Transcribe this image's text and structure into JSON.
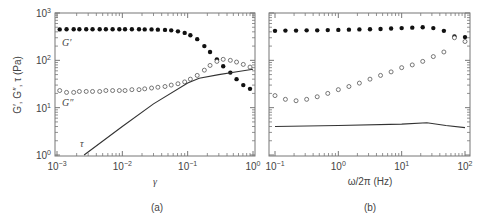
{
  "chart_data": [
    {
      "panel": "(a)",
      "type": "scatter",
      "xscale": "log",
      "yscale": "log",
      "xlabel": "γ",
      "ylabel": "G′, G″, τ (Pa)",
      "xlim": [
        0.001,
        1
      ],
      "ylim": [
        1,
        1000
      ],
      "xticks": [
        "10-3",
        "10-2",
        "10-1",
        "10^0"
      ],
      "yticks": [
        "10^0",
        "10^1",
        "10^2",
        "10^3"
      ],
      "grid": false,
      "annotations": [
        "G′",
        "G″",
        "τ"
      ],
      "series": [
        {
          "name": "G′",
          "marker": "filled-circle",
          "x": [
            0.0011,
            0.0014,
            0.0018,
            0.0022,
            0.0028,
            0.0035,
            0.0045,
            0.0056,
            0.0071,
            0.009,
            0.011,
            0.014,
            0.018,
            0.022,
            0.028,
            0.035,
            0.045,
            0.056,
            0.071,
            0.09,
            0.11,
            0.14,
            0.18,
            0.22,
            0.28,
            0.35,
            0.45,
            0.56,
            0.71,
            0.9
          ],
          "y": [
            450,
            455,
            455,
            455,
            455,
            455,
            455,
            455,
            455,
            455,
            455,
            455,
            455,
            450,
            450,
            445,
            440,
            430,
            410,
            380,
            340,
            280,
            200,
            150,
            105,
            75,
            55,
            40,
            30,
            25
          ]
        },
        {
          "name": "G″",
          "marker": "open-circle",
          "x": [
            0.0011,
            0.0014,
            0.0018,
            0.0022,
            0.0028,
            0.0035,
            0.0045,
            0.0056,
            0.0071,
            0.009,
            0.011,
            0.014,
            0.018,
            0.022,
            0.028,
            0.035,
            0.045,
            0.056,
            0.071,
            0.09,
            0.11,
            0.14,
            0.18,
            0.22,
            0.28,
            0.35,
            0.45,
            0.56,
            0.71,
            0.9
          ],
          "y": [
            23,
            21,
            21,
            22,
            22,
            22,
            22,
            23,
            23,
            23,
            23,
            24,
            24,
            25,
            26,
            27,
            28,
            30,
            32,
            35,
            40,
            48,
            62,
            78,
            95,
            105,
            100,
            92,
            82,
            72
          ]
        },
        {
          "name": "τ",
          "marker": "line",
          "x": [
            0.0026,
            0.01,
            0.03,
            0.1,
            0.15,
            0.3,
            0.6,
            1.0
          ],
          "y": [
            1,
            4,
            12,
            33,
            42,
            50,
            58,
            65
          ]
        }
      ]
    },
    {
      "panel": "(b)",
      "type": "scatter",
      "xscale": "log",
      "yscale": "log",
      "xlabel": "ω/2π (Hz)",
      "ylabel": "",
      "xlim": [
        0.1,
        100
      ],
      "ylim": [
        1,
        1000
      ],
      "xticks": [
        "10-1",
        "10^0",
        "10^1",
        "10^2"
      ],
      "grid": false,
      "series": [
        {
          "name": "G′",
          "marker": "filled-circle",
          "x": [
            0.1,
            0.146,
            0.215,
            0.316,
            0.464,
            0.681,
            1.0,
            1.47,
            2.15,
            3.16,
            4.64,
            6.81,
            10,
            14.7,
            21.5,
            31.6,
            46.4,
            68.1,
            100
          ],
          "y": [
            420,
            425,
            425,
            430,
            430,
            435,
            440,
            445,
            450,
            455,
            460,
            470,
            480,
            490,
            500,
            480,
            420,
            320,
            310
          ]
        },
        {
          "name": "G″",
          "marker": "open-circle",
          "x": [
            0.1,
            0.146,
            0.215,
            0.316,
            0.464,
            0.681,
            1.0,
            1.47,
            2.15,
            3.16,
            4.64,
            6.81,
            10,
            14.7,
            21.5,
            31.6,
            46.4,
            68.1,
            100
          ],
          "y": [
            18,
            15,
            14,
            15,
            17,
            20,
            24,
            28,
            33,
            40,
            48,
            57,
            70,
            80,
            95,
            120,
            150,
            300,
            250
          ]
        },
        {
          "name": "τ",
          "marker": "line",
          "x": [
            0.1,
            1,
            10,
            25,
            50,
            100
          ],
          "y": [
            4.0,
            4.2,
            4.5,
            4.8,
            4.2,
            3.8
          ]
        }
      ]
    }
  ],
  "labels": {
    "ylabel": "G′, G″, τ (Pa)",
    "a_xlabel": "γ",
    "b_xlabel": "ω/2π (Hz)",
    "a_panel": "(a)",
    "b_panel": "(b)",
    "g1": "G′",
    "g2": "G″",
    "tau": "τ"
  }
}
